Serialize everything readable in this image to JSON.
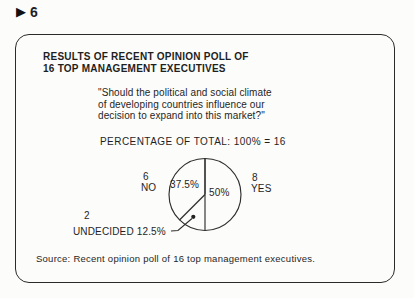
{
  "page": {
    "background": "#fcfcfa",
    "ink": "#1f1f1f",
    "frame_border": "#2b2b2b"
  },
  "marker": {
    "icon": "▶",
    "number": "6"
  },
  "slide": {
    "title": "RESULTS OF RECENT OPINION POLL OF\n16 TOP MANAGEMENT EXECUTIVES",
    "question": "\"Should the political and social climate\nof developing countries influence our\ndecision to expand into this market?\"",
    "source": "Source: Recent opinion poll of 16 top management executives."
  },
  "chart_data": {
    "type": "pie",
    "title": "PERCENTAGE OF TOTAL: 100% = 16",
    "total": 16,
    "start_angle": "top",
    "direction": "clockwise",
    "grid": false,
    "legend_position": "labels-around-pie",
    "slices": [
      {
        "label": "YES",
        "count": 8,
        "value": 50,
        "pct_label": "50%"
      },
      {
        "label": "UNDECIDED",
        "count": 2,
        "value": 12.5,
        "pct_label": "12.5%"
      },
      {
        "label": "NO",
        "count": 6,
        "value": 37.5,
        "pct_label": "37.5%"
      }
    ]
  }
}
